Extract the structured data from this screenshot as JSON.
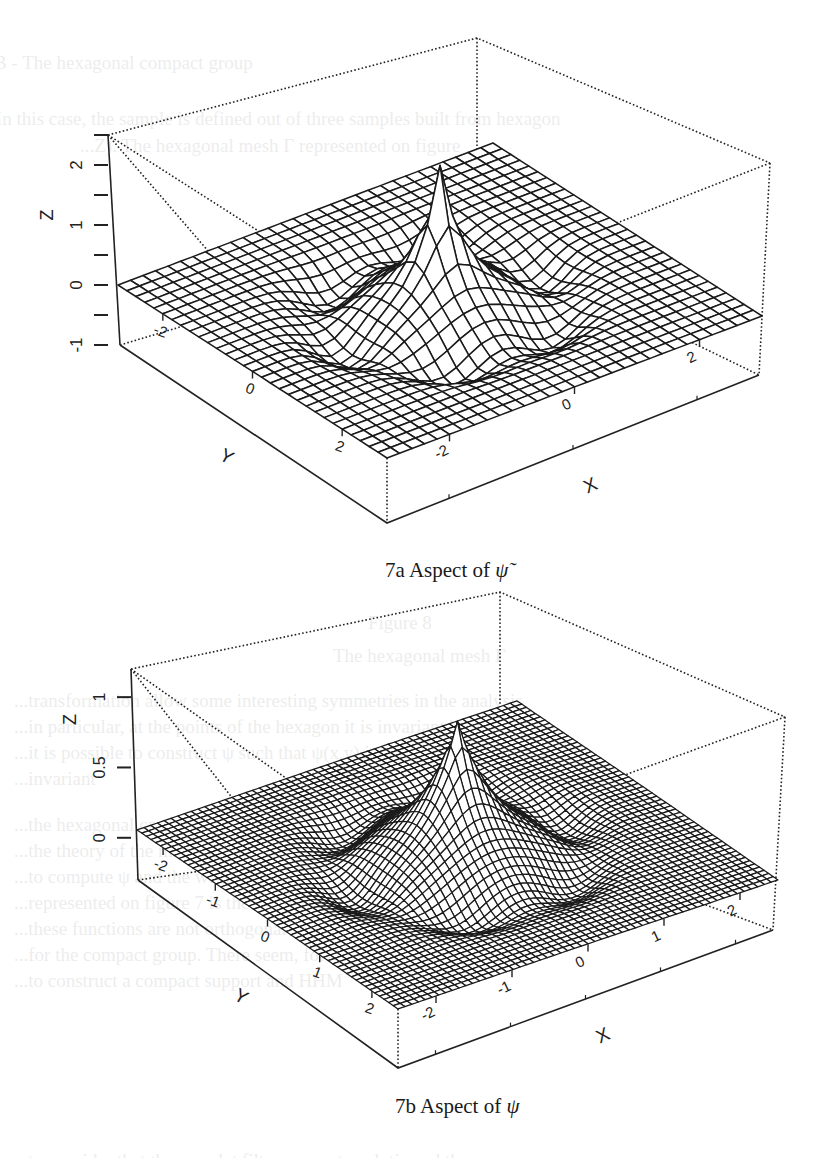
{
  "ghost_text": {
    "lines": [
      {
        "text": "B - The hexagonal compact group",
        "x": -6,
        "y": 52
      },
      {
        "text": "In this case, the sample is defined out of three samples built from hexagon",
        "x": -4,
        "y": 108
      },
      {
        "text": "...Z). The hexagonal mesh Γ represented on figure",
        "x": 80,
        "y": 135
      },
      {
        "text": "Figure 8",
        "x": 368,
        "y": 612
      },
      {
        "text": "The hexagonal mesh Γ",
        "x": 333,
        "y": 645
      },
      {
        "text": "...transformation allow some interesting symmetries in the analysis",
        "x": 14,
        "y": 690
      },
      {
        "text": "...in particular, at the points of the hexagon it is invariant by a rotation",
        "x": 14,
        "y": 716
      },
      {
        "text": "...it is possible to construct ψ such that ψ(x,y) is",
        "x": 14,
        "y": 742
      },
      {
        "text": "...invariant",
        "x": 14,
        "y": 768
      },
      {
        "text": "...the hexagonal compact group, using the same process as for the",
        "x": 14,
        "y": 814
      },
      {
        "text": "...the theory of the mesh is more complicated, both in the strategy",
        "x": 14,
        "y": 840
      },
      {
        "text": "...to compute ψ and the wavelet ψ. As an example, we computed the",
        "x": 14,
        "y": 866
      },
      {
        "text": "...represented on figure 7 is the same problem, except",
        "x": 14,
        "y": 892
      },
      {
        "text": "...these functions are not orthogonal and the orthogonal",
        "x": 14,
        "y": 918
      },
      {
        "text": "...for the compact group. There seem, for instance,",
        "x": 14,
        "y": 944
      },
      {
        "text": "...to construct a compact support and HHM",
        "x": 14,
        "y": 970
      },
      {
        "text": "...to consider that the wavelet filters are not analytic and the",
        "x": 14,
        "y": 1150
      }
    ]
  },
  "chart_data": [
    {
      "type": "surface3d",
      "id": "7a",
      "title": "7a Aspect of ψ̃",
      "caption_prefix": "7a Aspect of ",
      "caption_symbol": "ψ̃",
      "xlabel": "X",
      "ylabel": "Y",
      "zlabel": "Z",
      "xlim": [
        -3,
        3
      ],
      "ylim": [
        -3,
        3
      ],
      "zlim": [
        -1,
        2.5
      ],
      "x_ticks": [
        -2,
        0,
        2
      ],
      "y_ticks": [
        -2,
        0,
        2
      ],
      "z_ticks": [
        -1,
        0,
        1,
        2
      ],
      "z_tick_labels": [
        "-1",
        "0",
        "1",
        "2"
      ],
      "z_minor_ticks": [
        -0.5,
        0.5,
        1.5,
        2.5
      ],
      "grid_resolution": 30,
      "peak_value": 2.25,
      "peak_location": [
        0,
        0
      ],
      "description": "Sharp central spike (~2.2) at origin surrounded by a hexagonal ring of shallow negative lobes, surface ~0 elsewhere",
      "frame": {
        "left_top": [
          108,
          135
        ],
        "back_top": [
          477,
          38
        ],
        "right_top": [
          770,
          163
        ],
        "left_zero": [
          118,
          285
        ],
        "back_zero": [
          477,
          178
        ],
        "right_zero": [
          762,
          316
        ],
        "front_zero": [
          387,
          458
        ],
        "left_bottom": [
          120,
          345
        ],
        "right_bottom": [
          759,
          375
        ],
        "front_bottom": [
          387,
          523
        ]
      },
      "caption_pos": [
        385,
        572
      ]
    },
    {
      "type": "surface3d",
      "id": "7b",
      "title": "7b Aspect of ψ",
      "caption_prefix": "7b Aspect of ",
      "caption_symbol": "ψ",
      "xlabel": "X",
      "ylabel": "Y",
      "zlabel": "Z",
      "xlim": [
        -2.5,
        2.5
      ],
      "ylim": [
        -2.5,
        2.5
      ],
      "zlim": [
        -0.3,
        1.2
      ],
      "x_ticks": [
        -2,
        -1,
        0,
        1,
        2
      ],
      "y_ticks": [
        -2,
        -1,
        0,
        1,
        2
      ],
      "z_ticks": [
        0,
        0.5,
        1
      ],
      "z_tick_labels": [
        "0",
        "0.5",
        "1"
      ],
      "z_minor_ticks": [],
      "grid_resolution": 56,
      "peak_value": 0.95,
      "peak_location": [
        0,
        0
      ],
      "description": "Central cone-shaped peak (~0.95) at origin with hexagonal ring of small negative dips, surface ~0 elsewhere",
      "frame": {
        "left_top": [
          131,
          669
        ],
        "back_top": [
          500,
          592
        ],
        "right_top": [
          785,
          717
        ],
        "left_zero": [
          137,
          830
        ],
        "back_zero": [
          500,
          778
        ],
        "right_zero": [
          778,
          880
        ],
        "front_zero": [
          398,
          1009
        ],
        "left_bottom": [
          138,
          880
        ],
        "right_bottom": [
          773,
          930
        ],
        "front_bottom": [
          398,
          1068
        ]
      },
      "caption_pos": [
        395,
        1108
      ]
    }
  ]
}
